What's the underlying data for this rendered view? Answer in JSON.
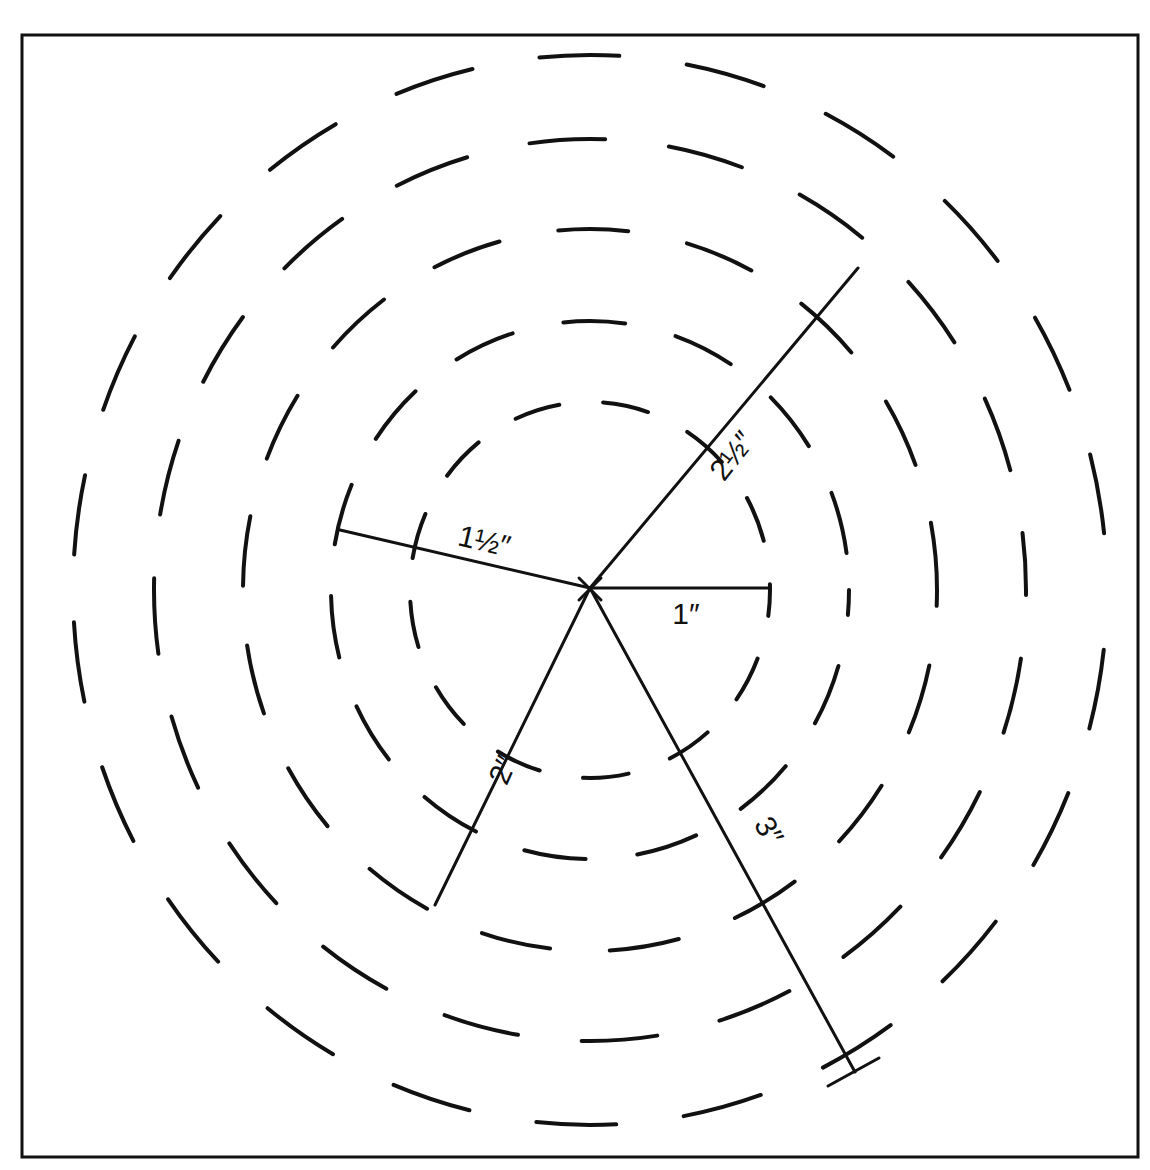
{
  "diagram": {
    "center": {
      "x": 590,
      "y": 590
    },
    "center_marker": "x-mark",
    "frame": {
      "x": 22,
      "y": 35,
      "width": 1116,
      "height": 1122
    },
    "rings": [
      {
        "rx": 180,
        "ry": 188,
        "dash": "46 44"
      },
      {
        "rx": 259,
        "ry": 269,
        "dash": "62 52"
      },
      {
        "rx": 347,
        "ry": 361,
        "dash": "70 60"
      },
      {
        "rx": 436,
        "ry": 451,
        "dash": "76 64"
      },
      {
        "rx": 517,
        "ry": 535,
        "dash": "80 68"
      }
    ],
    "radii": [
      {
        "label": "1″",
        "x2": 770,
        "y2": 588,
        "label_x": 686,
        "label_y": 624,
        "rotate": 0
      },
      {
        "label": "1½″",
        "x2": 340,
        "y2": 530,
        "label_x": 482,
        "label_y": 551,
        "rotate": 13
      },
      {
        "label": "2½″",
        "x2": 858,
        "y2": 268,
        "label_x": 740,
        "label_y": 462,
        "rotate": -52
      },
      {
        "label": "2″",
        "x2": 435,
        "y2": 905,
        "label_x": 512,
        "label_y": 774,
        "rotate": -66
      },
      {
        "label": "3″",
        "x2": 855,
        "y2": 1072,
        "label_x": 760,
        "label_y": 836,
        "rotate": 60,
        "end_cap": {
          "x1": 828,
          "y1": 1086,
          "x2": 879,
          "y2": 1058
        }
      }
    ],
    "colors": {
      "stroke": "#111111",
      "background": "#ffffff"
    }
  }
}
